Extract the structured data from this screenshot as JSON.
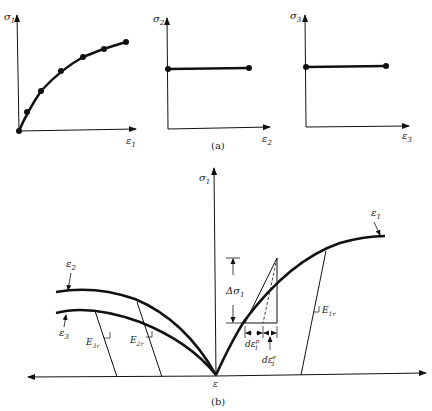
{
  "part_a": {
    "caption": "(a)",
    "plots": [
      {
        "y_label": "σ",
        "y_sub": "1",
        "x_label": "ε",
        "x_sub": "1",
        "shape": "increasing concave curve with data points"
      },
      {
        "y_label": "σ",
        "y_sub": "2",
        "x_label": "ε",
        "x_sub": "2",
        "shape": "horizontal line"
      },
      {
        "y_label": "σ",
        "y_sub": "3",
        "x_label": "ε",
        "x_sub": "3",
        "shape": "horizontal line"
      }
    ]
  },
  "part_b": {
    "caption": "(b)",
    "vertical_axis": {
      "label": "σ",
      "sub": "1"
    },
    "origin_label": "ε",
    "curves": [
      {
        "label": "ε",
        "sub": "1"
      },
      {
        "label": "ε",
        "sub": "2"
      },
      {
        "label": "ε",
        "sub": "3"
      }
    ],
    "annotations": {
      "delta_sigma": {
        "label": "Δσ",
        "sub": "1"
      },
      "plastic_strain": {
        "label": "dε",
        "sup": "p",
        "sub": "1"
      },
      "elastic_strain": {
        "label": "dε",
        "sup": "e",
        "sub": "1"
      },
      "E1r": {
        "label": "E",
        "sub": "1r"
      },
      "E2r": {
        "label": "E",
        "sub": "2r"
      },
      "E3r": {
        "label": "E",
        "sub": "3r"
      }
    }
  }
}
